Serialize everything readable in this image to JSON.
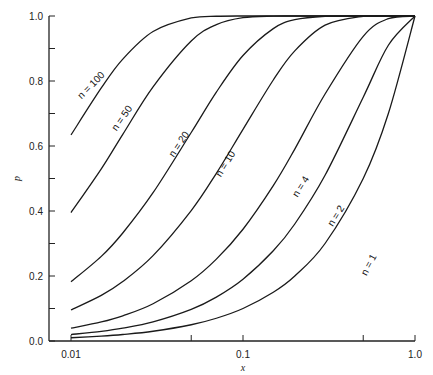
{
  "chart_data": {
    "type": "line",
    "title": "",
    "xlabel": "x",
    "ylabel": "p",
    "xscale": "log",
    "xlim": [
      0.01,
      1.0
    ],
    "ylim": [
      0.0,
      1.0
    ],
    "grid": false,
    "legend": "inline curve labels",
    "x_ticks": [
      0.01,
      0.05,
      0.1,
      0.5,
      1.0
    ],
    "x_tick_labels": [
      "0.01",
      "",
      "0.1",
      "",
      "1.0"
    ],
    "y_ticks": [
      0.0,
      0.1,
      0.2,
      0.3,
      0.4,
      0.5,
      0.6,
      0.7,
      0.8,
      0.9,
      1.0
    ],
    "y_tick_labels": [
      "0.0",
      "",
      "0.2",
      "",
      "0.4",
      "",
      "0.6",
      "",
      "0.8",
      "",
      "1.0"
    ],
    "x": [
      0.01,
      0.015,
      0.02,
      0.03,
      0.05,
      0.07,
      0.1,
      0.15,
      0.2,
      0.3,
      0.5,
      0.7,
      1.0
    ],
    "series": [
      {
        "name": "n=1",
        "label": "n = 1",
        "values": [
          0.01,
          0.015,
          0.02,
          0.03,
          0.05,
          0.07,
          0.1,
          0.15,
          0.2,
          0.3,
          0.5,
          0.7,
          1.0
        ],
        "label_pos": [
          0.56,
          0.23,
          -62
        ]
      },
      {
        "name": "n=2",
        "label": "n = 2",
        "values": [
          0.0199,
          0.0298,
          0.0396,
          0.0591,
          0.0975,
          0.1351,
          0.19,
          0.2775,
          0.36,
          0.51,
          0.75,
          0.91,
          1.0
        ],
        "label_pos": [
          0.36,
          0.38,
          -58
        ]
      },
      {
        "name": "n=4",
        "label": "n = 4",
        "values": [
          0.0394,
          0.0587,
          0.0776,
          0.1147,
          0.1855,
          0.2519,
          0.3439,
          0.478,
          0.5904,
          0.7599,
          0.9375,
          0.9919,
          1.0
        ],
        "label_pos": [
          0.225,
          0.47,
          -58
        ]
      },
      {
        "name": "n=10",
        "label": "n = 10",
        "values": [
          0.0956,
          0.1404,
          0.1829,
          0.2626,
          0.4013,
          0.516,
          0.6513,
          0.8031,
          0.8926,
          0.9718,
          0.999,
          1.0,
          1.0
        ],
        "label_pos": [
          0.082,
          0.54,
          -58
        ]
      },
      {
        "name": "n=20",
        "label": "n = 20",
        "values": [
          0.1821,
          0.2603,
          0.3324,
          0.4562,
          0.6415,
          0.7658,
          0.8784,
          0.9612,
          0.9885,
          0.9992,
          1.0,
          1.0,
          1.0
        ],
        "label_pos": [
          0.044,
          0.6,
          -56
        ]
      },
      {
        "name": "n=50",
        "label": "n = 50",
        "values": [
          0.395,
          0.5296,
          0.6358,
          0.7819,
          0.9231,
          0.9734,
          0.9948,
          0.9997,
          1.0,
          1.0,
          1.0,
          1.0,
          1.0
        ],
        "label_pos": [
          0.0205,
          0.68,
          -55
        ]
      },
      {
        "name": "n=100",
        "label": "n = 100",
        "values": [
          0.634,
          0.7785,
          0.8674,
          0.9524,
          0.9941,
          0.9993,
          1.0,
          1.0,
          1.0,
          1.0,
          1.0,
          1.0,
          1.0
        ],
        "label_pos": [
          0.0135,
          0.78,
          -45
        ]
      }
    ]
  }
}
